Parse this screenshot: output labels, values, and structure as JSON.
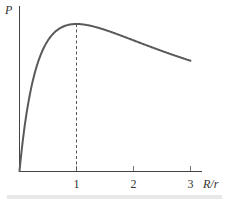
{
  "chart_data": {
    "type": "line",
    "title": "",
    "xlabel": "R/r",
    "ylabel": "P",
    "x_ticks": [
      "1",
      "2",
      "3"
    ],
    "xlim": [
      0,
      3
    ],
    "ylim": [
      0,
      1.05
    ],
    "grid": false,
    "legend": null,
    "series": [
      {
        "name": "P",
        "x": [
          0,
          0.05,
          0.1,
          0.2,
          0.3,
          0.5,
          0.75,
          1.0,
          1.5,
          2.0,
          2.5,
          3.0
        ],
        "values": [
          0,
          0.181,
          0.331,
          0.556,
          0.71,
          0.889,
          0.98,
          1.0,
          0.96,
          0.889,
          0.816,
          0.75
        ]
      }
    ],
    "annotations": [
      {
        "type": "dashed-vertical-line",
        "x": 1,
        "from": 0,
        "to": 1.0,
        "note": "maximum power at R/r = 1"
      }
    ]
  },
  "axes": {
    "y_label": "P",
    "x_label": "R/r",
    "ticks": [
      "1",
      "2",
      "3"
    ]
  },
  "colors": {
    "curve": "#5a5a5a",
    "axis": "#444444",
    "bottom_bar": "#e6e6e6"
  }
}
